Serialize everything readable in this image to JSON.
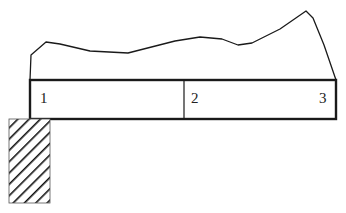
{
  "diagram": {
    "type": "cantilever-beam-with-distributed-load",
    "colors": {
      "stroke": "#1a1a1a",
      "background": "#ffffff",
      "hatch": "#111111"
    },
    "beam": {
      "x": 30,
      "y": 80,
      "width": 306,
      "height": 39,
      "divider_x": 184
    },
    "support": {
      "x": 9,
      "y": 119,
      "width": 41,
      "height": 84,
      "pattern": "diagonal-hatch"
    },
    "load_curve": {
      "points": "30,80 31,55 46,42 60,44 90,51 128,53 175,41 200,37 222,39 238,45 252,43 280,29 306,11 313,18 324,45 336,80"
    },
    "labels": [
      {
        "text": "1",
        "x": 40,
        "y": 103
      },
      {
        "text": "2",
        "x": 191,
        "y": 103
      },
      {
        "text": "3",
        "x": 319,
        "y": 103
      }
    ]
  }
}
